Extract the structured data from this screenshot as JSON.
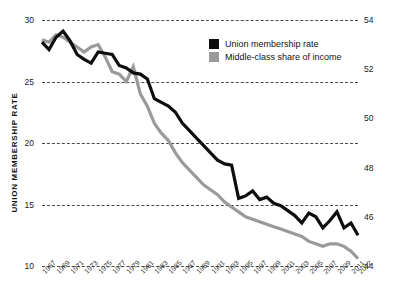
{
  "chart_data": {
    "type": "line",
    "title": "",
    "xlabel": "",
    "grid": true,
    "legend_position": "top-right",
    "x": [
      1967,
      1968,
      1969,
      1970,
      1971,
      1972,
      1973,
      1974,
      1975,
      1976,
      1977,
      1978,
      1979,
      1980,
      1981,
      1982,
      1983,
      1984,
      1985,
      1986,
      1987,
      1988,
      1989,
      1990,
      1991,
      1992,
      1993,
      1994,
      1995,
      1996,
      1997,
      1998,
      1999,
      2000,
      2001,
      2002,
      2003,
      2004,
      2005,
      2006,
      2007,
      2008,
      2009,
      2010,
      2011,
      2012
    ],
    "xtick_labels": [
      "1967",
      "1969",
      "1971",
      "1973",
      "1975",
      "1977",
      "1979",
      "1981",
      "1983",
      "1985",
      "1987",
      "1989",
      "1991",
      "1993",
      "1995",
      "1997",
      "1999",
      "2001",
      "2003",
      "2005",
      "2007",
      "2009",
      "2011",
      "2012"
    ],
    "series": [
      {
        "name": "Union membership rate",
        "axis": "left",
        "color": "#0d0d0d",
        "ylabel": "UNION MEMBERSHIP RATE",
        "ylim": [
          10,
          30
        ],
        "ytick_labels": [
          "30",
          "25",
          "20",
          "15",
          "10"
        ],
        "yticks": [
          30,
          25,
          20,
          15,
          10
        ],
        "values": [
          28.2,
          27.6,
          28.6,
          29.1,
          28.3,
          27.2,
          26.8,
          26.5,
          27.4,
          27.3,
          27.2,
          26.3,
          26.1,
          25.7,
          25.6,
          25.2,
          23.6,
          23.3,
          23.0,
          22.5,
          21.6,
          21.0,
          20.4,
          19.8,
          19.2,
          18.6,
          18.3,
          18.2,
          15.5,
          15.7,
          16.1,
          15.4,
          15.6,
          15.1,
          14.9,
          14.5,
          14.1,
          13.5,
          14.3,
          14.0,
          13.1,
          13.7,
          14.4,
          13.1,
          13.5,
          12.5
        ]
      },
      {
        "name": "Middle-class share of income",
        "axis": "right",
        "color": "#9a9a9a",
        "ylabel": "MIDDLE-CLASS SHARE OF AGGREGATE INCOME",
        "ylim": [
          44,
          54
        ],
        "ytick_labels": [
          "54",
          "52",
          "50",
          "48",
          "46",
          "44"
        ],
        "yticks": [
          54,
          52,
          50,
          48,
          46,
          44
        ],
        "values": [
          53.2,
          53.1,
          53.4,
          53.3,
          53.1,
          52.9,
          52.7,
          52.9,
          53.0,
          52.5,
          51.9,
          51.8,
          51.5,
          52.1,
          51.0,
          50.5,
          49.8,
          49.4,
          49.1,
          48.6,
          48.2,
          47.9,
          47.6,
          47.3,
          47.1,
          46.9,
          46.6,
          46.4,
          46.2,
          46.0,
          45.9,
          45.8,
          45.7,
          45.6,
          45.5,
          45.4,
          45.3,
          45.2,
          45.0,
          44.9,
          44.8,
          44.9,
          44.9,
          44.8,
          44.6,
          44.3
        ]
      }
    ]
  },
  "legend": {
    "items": [
      {
        "label": "Union membership rate",
        "color": "#0d0d0d"
      },
      {
        "label": "Middle-class share of income",
        "color": "#9a9a9a"
      }
    ]
  },
  "axes": {
    "left": {
      "title": "UNION MEMBERSHIP RATE",
      "ticks": [
        "30",
        "25",
        "20",
        "15",
        "10"
      ]
    },
    "right": {
      "title": "MIDDLE-CLASS SHARE OF AGGREGATE INCOME",
      "ticks": [
        "54",
        "52",
        "50",
        "48",
        "46",
        "44"
      ]
    }
  }
}
